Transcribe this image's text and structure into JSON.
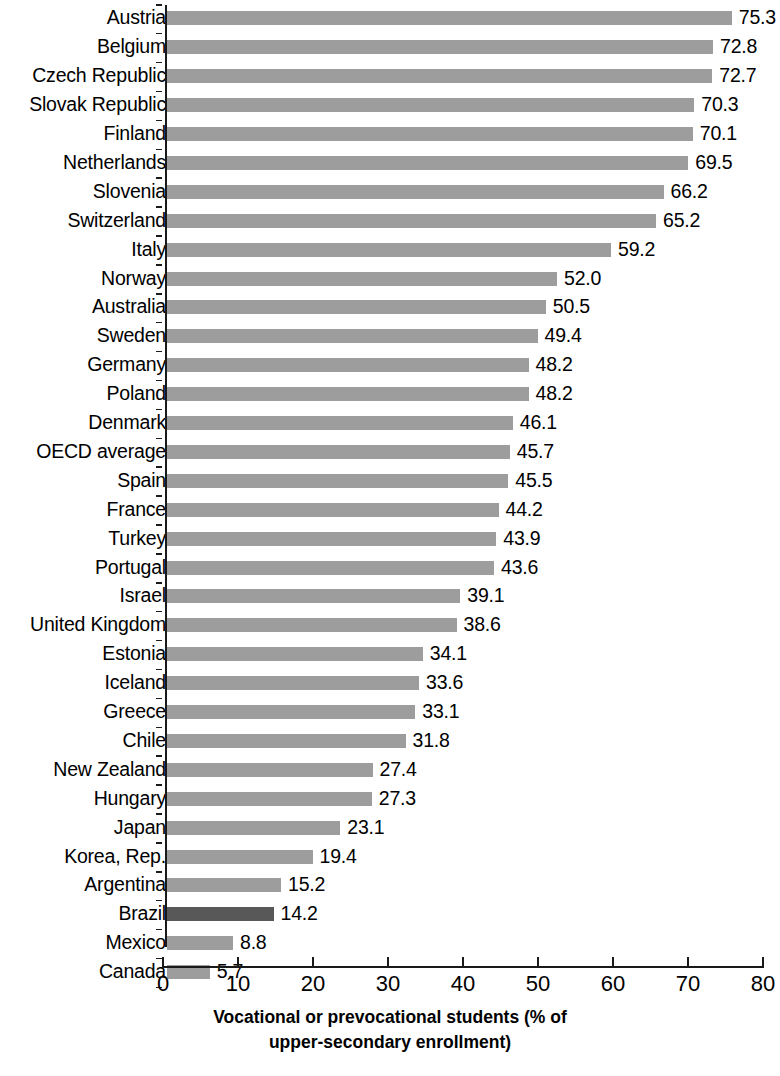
{
  "chart_data": {
    "type": "bar",
    "orientation": "horizontal",
    "title": "",
    "xlabel": "Vocational or prevocational students (% of upper-secondary enrollment)",
    "xlabel_line1": "Vocational or prevocational students (% of",
    "xlabel_line2": "upper-secondary enrollment)",
    "ylabel": "",
    "xlim": [
      0,
      80
    ],
    "xticks": [
      0,
      10,
      20,
      30,
      40,
      50,
      60,
      70,
      80
    ],
    "xtick_labels": [
      "0",
      "10",
      "20",
      "30",
      "40",
      "50",
      "60",
      "70",
      "80"
    ],
    "grid": false,
    "legend": "none",
    "bar_color": "#9d9d9d",
    "highlight_color": "#585858",
    "highlighted_category": "Brazil",
    "categories": [
      "Austria",
      "Belgium",
      "Czech Republic",
      "Slovak Republic",
      "Finland",
      "Netherlands",
      "Slovenia",
      "Switzerland",
      "Italy",
      "Norway",
      "Australia",
      "Sweden",
      "Germany",
      "Poland",
      "Denmark",
      "OECD average",
      "Spain",
      "France",
      "Turkey",
      "Portugal",
      "Israel",
      "United Kingdom",
      "Estonia",
      "Iceland",
      "Greece",
      "Chile",
      "New Zealand",
      "Hungary",
      "Japan",
      "Korea, Rep.",
      "Argentina",
      "Brazil",
      "Mexico",
      "Canada"
    ],
    "values": [
      75.3,
      72.8,
      72.7,
      70.3,
      70.1,
      69.5,
      66.2,
      65.2,
      59.2,
      52.0,
      50.5,
      49.4,
      48.2,
      48.2,
      46.1,
      45.7,
      45.5,
      44.2,
      43.9,
      43.6,
      39.1,
      38.6,
      34.1,
      33.6,
      33.1,
      31.8,
      27.4,
      27.3,
      23.1,
      19.4,
      15.2,
      14.2,
      8.8,
      5.7
    ],
    "value_labels": [
      "75.3",
      "72.8",
      "72.7",
      "70.3",
      "70.1",
      "69.5",
      "66.2",
      "65.2",
      "59.2",
      "52.0",
      "50.5",
      "49.4",
      "48.2",
      "48.2",
      "46.1",
      "45.7",
      "45.5",
      "44.2",
      "43.9",
      "43.6",
      "39.1",
      "38.6",
      "34.1",
      "33.6",
      "33.1",
      "31.8",
      "27.4",
      "27.3",
      "23.1",
      "19.4",
      "15.2",
      "14.2",
      "8.8",
      "5.7"
    ]
  }
}
